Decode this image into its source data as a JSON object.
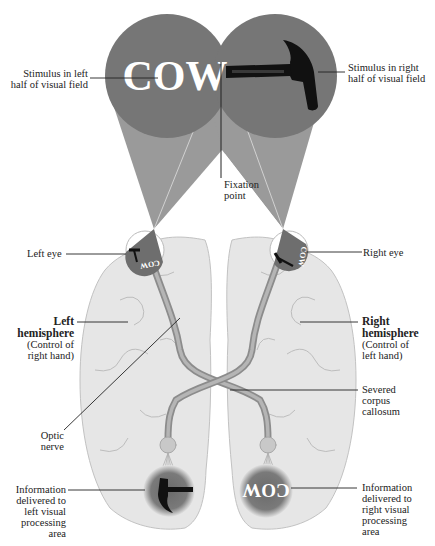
{
  "colors": {
    "background": "#ffffff",
    "visual_field": "#767676",
    "cone": "#9a9a9a",
    "brain": "#e6e6e6",
    "brain_outline": "#bdbdbd",
    "nerve": "#9c9c9c",
    "label_text": "#222222",
    "stimulus_text": "#ffffff",
    "hammer": "#111111"
  },
  "stimuli": {
    "left_word": "COW",
    "right_icon": "hammer-icon",
    "left_eye_word": "COW",
    "right_eye_word": "COW",
    "left_processing_icon": "hammer-icon",
    "right_processing_word": "COW"
  },
  "labels": {
    "stimulus_left": [
      "Stimulus in left",
      "half of visual field"
    ],
    "stimulus_right": [
      "Stimulus in right",
      "half of visual field"
    ],
    "fixation_point": [
      "Fixation",
      "point"
    ],
    "left_eye": "Left eye",
    "right_eye": "Right eye",
    "left_hemisphere": {
      "title": [
        "Left",
        "hemisphere"
      ],
      "detail": [
        "(Control of",
        "right hand)"
      ]
    },
    "right_hemisphere": {
      "title": [
        "Right",
        "hemisphere"
      ],
      "detail": [
        "(Control of",
        "left hand)"
      ]
    },
    "severed_corpus_callosum": [
      "Severed",
      "corpus",
      "callosum"
    ],
    "optic_nerve": [
      "Optic",
      "nerve"
    ],
    "info_left": [
      "Information",
      "delivered to",
      "left visual",
      "processing",
      "area"
    ],
    "info_right": [
      "Information",
      "delivered to",
      "right visual",
      "processing",
      "area"
    ]
  }
}
